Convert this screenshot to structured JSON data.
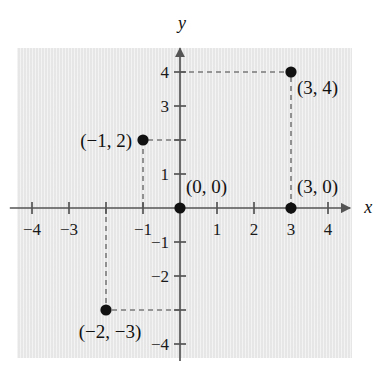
{
  "figure": {
    "background_color": "#ffffff",
    "panel_color": "#e9e9e9",
    "axis_color": "#555555",
    "dash_color": "#7a7a7a",
    "point_color": "#111111"
  },
  "axes": {
    "x_name": "x",
    "y_name": "y",
    "origin_px": {
      "x": 180,
      "y": 208
    },
    "unit_px": {
      "x": 37,
      "y": 34
    },
    "x_range": [
      -4.6,
      4.6
    ],
    "y_range": [
      -4.5,
      4.7
    ],
    "x_tick_values": [
      -4,
      -3,
      -2,
      -1,
      1,
      2,
      3,
      4
    ],
    "y_tick_values": [
      4,
      3,
      2,
      1,
      -1,
      -2,
      -3,
      -4
    ],
    "x_tick_labels": [
      {
        "value": -4,
        "label": "−4",
        "visible": true
      },
      {
        "value": -3,
        "label": "−3",
        "visible": true
      },
      {
        "value": -2,
        "label": "−2",
        "visible": false
      },
      {
        "value": -1,
        "label": "−1",
        "visible": true
      },
      {
        "value": 1,
        "label": "1",
        "visible": true
      },
      {
        "value": 2,
        "label": "2",
        "visible": true
      },
      {
        "value": 3,
        "label": "3",
        "visible": true
      },
      {
        "value": 4,
        "label": "4",
        "visible": true
      }
    ],
    "y_tick_labels": [
      {
        "value": 4,
        "label": "4",
        "visible": true
      },
      {
        "value": 3,
        "label": "3",
        "visible": true
      },
      {
        "value": 2,
        "label": "2",
        "visible": false
      },
      {
        "value": 1,
        "label": "1",
        "visible": true
      },
      {
        "value": -1,
        "label": "−1",
        "visible": true
      },
      {
        "value": -2,
        "label": "−2",
        "visible": true
      },
      {
        "value": -3,
        "label": "−3",
        "visible": false
      },
      {
        "value": -4,
        "label": "−4",
        "visible": true
      }
    ]
  },
  "chart_data": {
    "type": "scatter",
    "title": "",
    "xlabel": "x",
    "ylabel": "y",
    "xlim": [
      -4.6,
      4.6
    ],
    "ylim": [
      -4.5,
      4.7
    ],
    "grid": false,
    "legend": "none",
    "points": [
      {
        "name": "origin",
        "x": 0,
        "y": 0,
        "label": "(0, 0)",
        "label_pos": "above-right",
        "guides": []
      },
      {
        "name": "x-intercept",
        "x": 3,
        "y": 0,
        "label": "(3, 0)",
        "label_pos": "above-right",
        "guides": []
      },
      {
        "name": "point-3-4",
        "x": 3,
        "y": 4,
        "label": "(3, 4)",
        "label_pos": "below-right",
        "guides": [
          "horizontal-to-y-axis",
          "vertical-to-x-axis"
        ]
      },
      {
        "name": "point-neg1-2",
        "x": -1,
        "y": 2,
        "label": "(−1, 2)",
        "label_pos": "left",
        "guides": [
          "horizontal-to-y-axis",
          "vertical-to-x-axis"
        ]
      },
      {
        "name": "point-neg2-neg3",
        "x": -2,
        "y": -3,
        "label": "(−2, −3)",
        "label_pos": "below-left",
        "guides": [
          "horizontal-to-y-axis",
          "vertical-to-x-axis"
        ]
      }
    ]
  }
}
